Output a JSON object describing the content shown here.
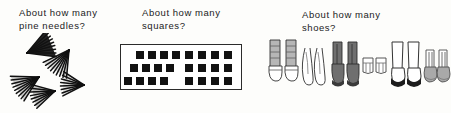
{
  "worksheet": {
    "panels": [
      {
        "id": "pine-needles",
        "prompt": "About how many\npine needles?",
        "subject": "pine needles",
        "illustration": "pine-needle-clusters",
        "cluster_count": 5,
        "needles_per_cluster": [
          9,
          9,
          9,
          8,
          8
        ],
        "total_needles": 43,
        "clusters": [
          {
            "x": 27,
            "y": 20,
            "rotation": -28,
            "length": 27,
            "spread": 44,
            "needles": 9
          },
          {
            "x": 69,
            "y": 17,
            "rotation": 118,
            "length": 26,
            "spread": 46,
            "needles": 9
          },
          {
            "x": 39,
            "y": 44,
            "rotation": 145,
            "length": 26,
            "spread": 46,
            "needles": 9
          },
          {
            "x": 55,
            "y": 58,
            "rotation": 160,
            "length": 23,
            "spread": 44,
            "needles": 8
          },
          {
            "x": 84,
            "y": 52,
            "rotation": 175,
            "length": 22,
            "spread": 42,
            "needles": 8
          }
        ]
      },
      {
        "id": "squares",
        "prompt": "About how many\nsquares?",
        "subject": "squares",
        "illustration": "black-squares-in-box",
        "box": {
          "border_color": "#2b2b2b",
          "fill": "#ffffff"
        },
        "square_color": "#121212",
        "groups": [
          {
            "name": "left-group",
            "count": 12,
            "rows": [
              {
                "count": 4,
                "x": 12,
                "y": 6,
                "gap": 12
              },
              {
                "count": 4,
                "x": 6,
                "y": 19,
                "gap": 12
              },
              {
                "count": 4,
                "x": 0,
                "y": 32,
                "gap": 12
              }
            ]
          },
          {
            "name": "right-group",
            "count": 12,
            "rows": [
              {
                "count": 4,
                "x": 0,
                "y": 6,
                "gap": 13
              },
              {
                "count": 4,
                "x": 0,
                "y": 19,
                "gap": 13
              },
              {
                "count": 4,
                "x": 0,
                "y": 32,
                "gap": 13
              }
            ]
          }
        ],
        "total_squares": 24
      },
      {
        "id": "shoes",
        "prompt": "About how many\nshoes?",
        "subject": "shoes",
        "illustration": "six-pairs-of-footwear",
        "pair_count": 6,
        "total_shoes": 12,
        "pairs": [
          {
            "name": "high-top-sneakers",
            "body": "#b6b6b6",
            "sole": "#ffffff",
            "accent": "#5e5e5e"
          },
          {
            "name": "thong-sandals",
            "body": "#ffffff",
            "sole": "#ffffff",
            "accent": "#6a6a6a"
          },
          {
            "name": "work-boots",
            "body": "#6f6f6f",
            "sole": "#4a4a4a",
            "accent": "#2e2e2e"
          },
          {
            "name": "baby-shoes",
            "body": "#ffffff",
            "sole": "#ffffff",
            "accent": "#6a6a6a"
          },
          {
            "name": "tall-boots",
            "body": "#ffffff",
            "sole": "#1d1d1d",
            "accent": "#3a3a3a"
          },
          {
            "name": "loafers",
            "body": "#a9a9a9",
            "sole": "#7b7b7b",
            "accent": "#4f4f4f"
          }
        ]
      }
    ]
  },
  "colors": {
    "ink": "#1b1b1b",
    "paper": "#fdfdfb",
    "square_fill": "#121212",
    "box_border": "#2b2b2b"
  }
}
